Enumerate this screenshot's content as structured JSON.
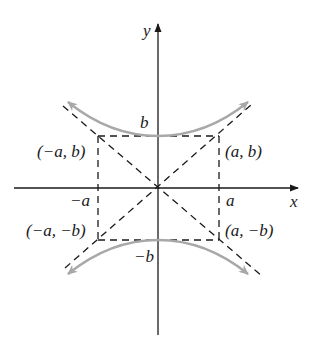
{
  "diagram": {
    "axes": {
      "x_label": "x",
      "y_label": "y"
    },
    "tick_labels": {
      "pos_a": "a",
      "neg_a": "−a",
      "pos_b": "b",
      "neg_b": "−b"
    },
    "corner_labels": {
      "top_left": "(−a, b)",
      "top_right": "(a, b)",
      "bottom_left": "(−a, −b)",
      "bottom_right": "(a, −b)"
    },
    "colors": {
      "axis": "#1a1a1a",
      "dashed": "#1a1a1a",
      "curve": "#a8a8a8",
      "background": "#ffffff"
    }
  }
}
